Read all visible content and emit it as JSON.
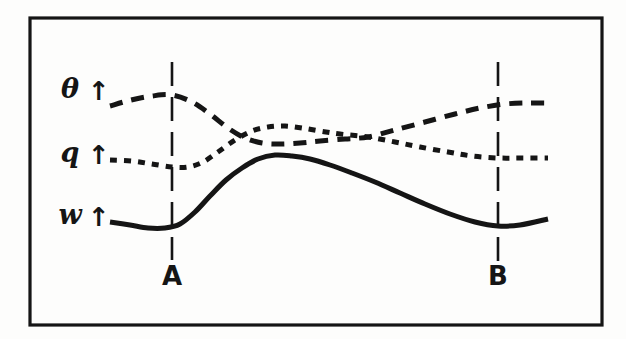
{
  "figure": {
    "background_color": "#fdfdfc",
    "ink_color": "#151515",
    "frame": {
      "name": "figure-border",
      "x": 30,
      "y": 18,
      "width": 572,
      "height": 307,
      "stroke_width": 3.2
    }
  },
  "axis_labels": [
    {
      "symbol": "θ",
      "arrow": "↑",
      "y": 98,
      "label_x": 70,
      "arrow_x": 99
    },
    {
      "symbol": "q",
      "arrow": "↑",
      "y": 162,
      "label_x": 70,
      "arrow_x": 99
    },
    {
      "symbol": "w",
      "arrow": "↑",
      "y": 224,
      "label_x": 70,
      "arrow_x": 99
    }
  ],
  "markers": [
    {
      "label": "A",
      "x": 172,
      "line_top": 62,
      "line_bottom": 260,
      "label_y": 285
    },
    {
      "label": "B",
      "x": 498,
      "line_top": 62,
      "line_bottom": 262,
      "label_y": 285
    }
  ],
  "chart_data": {
    "type": "line",
    "title": "",
    "subtitle": "",
    "xlabel": "",
    "ylabel": "",
    "grid": false,
    "legend_position": "left-inline",
    "axis_orientation": "y increases upward (arrows)",
    "xlim": [
      110,
      550
    ],
    "ylim_pixels": [
      62,
      262
    ],
    "annotations": [
      {
        "text": "A",
        "x": 172,
        "type": "vertical-reference-line"
      },
      {
        "text": "B",
        "x": 498,
        "type": "vertical-reference-line"
      }
    ],
    "series": [
      {
        "name": "θ",
        "label": "theta",
        "linestyle": "long-dashed",
        "dash_pattern": "13 9",
        "stroke_width": 5,
        "description": "rises to a maximum at reference line A, falls steeply to a broad minimum between A and mid-section, then rises steadily to the right edge ending high",
        "points": [
          [
            110,
            106
          ],
          [
            131,
            100
          ],
          [
            152,
            96
          ],
          [
            172,
            95
          ],
          [
            192,
            102
          ],
          [
            210,
            114
          ],
          [
            228,
            128
          ],
          [
            245,
            138
          ],
          [
            262,
            143
          ],
          [
            280,
            144
          ],
          [
            300,
            143
          ],
          [
            320,
            141
          ],
          [
            345,
            139
          ],
          [
            368,
            137
          ],
          [
            395,
            130
          ],
          [
            425,
            122
          ],
          [
            455,
            114
          ],
          [
            480,
            108
          ],
          [
            505,
            104
          ],
          [
            528,
            103
          ],
          [
            548,
            103
          ]
        ]
      },
      {
        "name": "q",
        "label": "specific humidity",
        "linestyle": "short-dashed",
        "dash_pattern": "7 7",
        "stroke_width": 5,
        "description": "flat then dips slightly to a minimum just past reference line A, rises to a maximum around mid-left, then decays steadily to a flat plateau past reference line B",
        "points": [
          [
            110,
            160
          ],
          [
            132,
            161
          ],
          [
            152,
            164
          ],
          [
            172,
            167
          ],
          [
            188,
            167
          ],
          [
            203,
            162
          ],
          [
            218,
            152
          ],
          [
            235,
            140
          ],
          [
            252,
            131
          ],
          [
            268,
            127
          ],
          [
            285,
            126
          ],
          [
            302,
            128
          ],
          [
            320,
            131
          ],
          [
            340,
            134
          ],
          [
            368,
            137
          ],
          [
            395,
            142
          ],
          [
            420,
            147
          ],
          [
            448,
            152
          ],
          [
            472,
            156
          ],
          [
            498,
            158
          ],
          [
            522,
            158
          ],
          [
            548,
            158
          ]
        ]
      },
      {
        "name": "w",
        "label": "vertical velocity",
        "linestyle": "solid",
        "dash_pattern": "none",
        "stroke_width": 5,
        "description": "flat with a shallow minimum at reference line A, rises steeply to a maximum shortly after A, then declines gradually to a minimum at reference line B and turns up slightly at the right edge",
        "points": [
          [
            110,
            222
          ],
          [
            130,
            225
          ],
          [
            148,
            228
          ],
          [
            165,
            228
          ],
          [
            180,
            224
          ],
          [
            195,
            212
          ],
          [
            210,
            196
          ],
          [
            226,
            180
          ],
          [
            242,
            168
          ],
          [
            258,
            159
          ],
          [
            275,
            155
          ],
          [
            292,
            156
          ],
          [
            310,
            159
          ],
          [
            330,
            165
          ],
          [
            352,
            173
          ],
          [
            375,
            182
          ],
          [
            400,
            193
          ],
          [
            425,
            204
          ],
          [
            450,
            214
          ],
          [
            475,
            222
          ],
          [
            498,
            226
          ],
          [
            520,
            225
          ],
          [
            548,
            219
          ]
        ]
      }
    ]
  }
}
